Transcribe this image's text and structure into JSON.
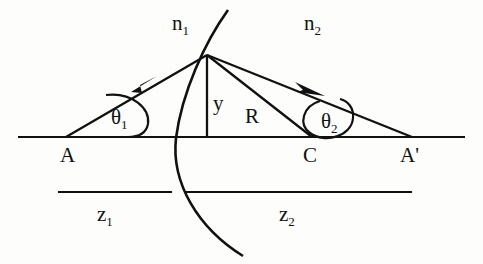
{
  "figure": {
    "background_color": "#fdfdfb",
    "ink_color": "#111111",
    "width": 483,
    "height": 264
  },
  "labels": {
    "n1": {
      "base": "n",
      "sub": "1",
      "x": 180,
      "y": 28
    },
    "n2": {
      "base": "n",
      "sub": "2",
      "x": 312,
      "y": 28
    },
    "theta1": {
      "base": "θ",
      "sub": "1",
      "x": 119,
      "y": 119
    },
    "theta2": {
      "base": "θ",
      "sub": "2",
      "x": 330,
      "y": 124
    },
    "y": {
      "base": "y",
      "sub": "",
      "x": 211,
      "y": 107
    },
    "R": {
      "base": "R",
      "sub": "",
      "x": 246,
      "y": 120
    },
    "A": {
      "base": "A",
      "sub": "",
      "x": 62,
      "y": 160
    },
    "C": {
      "base": "C",
      "sub": "",
      "x": 305,
      "y": 160
    },
    "Aprime": {
      "base": "A'",
      "sub": "",
      "x": 403,
      "y": 160
    },
    "z1": {
      "base": "z",
      "sub": "1",
      "x": 103,
      "y": 218
    },
    "z2": {
      "base": "z",
      "sub": "2",
      "x": 285,
      "y": 218
    }
  },
  "geometry": {
    "optical_axis": {
      "x1": 18,
      "y1": 137,
      "x2": 465,
      "y2": 137
    },
    "vertex_point": {
      "x": 207,
      "y": 55
    },
    "object_point_A": {
      "x": 66,
      "y": 137
    },
    "center_point_C": {
      "x": 312,
      "y": 137
    },
    "image_point_Aprime": {
      "x": 412,
      "y": 137
    },
    "normal_line": {
      "x1": 207,
      "y1": 55,
      "x2": 207,
      "y2": 137
    },
    "incident_ray": {
      "x1": 66,
      "y1": 137,
      "x2": 207,
      "y2": 55
    },
    "radius_line": {
      "x1": 207,
      "y1": 55,
      "x2": 312,
      "y2": 137
    },
    "refracted_ray": {
      "x1": 207,
      "y1": 55,
      "x2": 412,
      "y2": 137
    },
    "surface_arc": {
      "start_x": 228,
      "start_y": 10,
      "end_x": 243,
      "end_y": 256,
      "axis_crossing_x": 176
    },
    "z1_measure_line": {
      "x1": 58,
      "y1": 192,
      "x2": 172,
      "y2": 192
    },
    "z2_measure_line": {
      "x1": 186,
      "y1": 192,
      "x2": 412,
      "y2": 192
    },
    "arrow_incident": {
      "x": 148,
      "y": 85
    },
    "arrow_refracted": {
      "x": 315,
      "y": 92
    },
    "angle_arc_theta1": {
      "cx": 66,
      "cy": 137,
      "r": 62
    },
    "angle_arc_theta2": {
      "cx": 312,
      "cy": 137,
      "r": 36
    }
  }
}
